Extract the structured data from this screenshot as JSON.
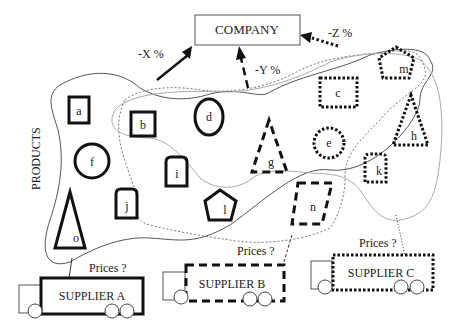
{
  "diagram": {
    "company": {
      "label": "COMPANY"
    },
    "side_label": "PRODUCTS",
    "discounts": [
      {
        "id": "x",
        "label": "-X %",
        "line_style": "solid"
      },
      {
        "id": "y",
        "label": "-Y %",
        "line_style": "dashed"
      },
      {
        "id": "z",
        "label": "-Z %",
        "line_style": "dotted"
      }
    ],
    "products": [
      {
        "id": "a",
        "label": "a",
        "shape": "square",
        "style": "solid"
      },
      {
        "id": "b",
        "label": "b",
        "shape": "square",
        "style": "solid"
      },
      {
        "id": "c",
        "label": "c",
        "shape": "rectangle",
        "style": "dotted"
      },
      {
        "id": "d",
        "label": "d",
        "shape": "ellipse",
        "style": "solid"
      },
      {
        "id": "e",
        "label": "e",
        "shape": "circle",
        "style": "dotted"
      },
      {
        "id": "f",
        "label": "f",
        "shape": "circle",
        "style": "solid"
      },
      {
        "id": "g",
        "label": "g",
        "shape": "triangle",
        "style": "dashed"
      },
      {
        "id": "h",
        "label": "h",
        "shape": "triangle",
        "style": "dotted"
      },
      {
        "id": "i",
        "label": "i",
        "shape": "tag",
        "style": "solid"
      },
      {
        "id": "j",
        "label": "j",
        "shape": "tag",
        "style": "solid"
      },
      {
        "id": "k",
        "label": "k",
        "shape": "tag",
        "style": "dotted"
      },
      {
        "id": "l",
        "label": "l",
        "shape": "pentagon",
        "style": "solid"
      },
      {
        "id": "m",
        "label": "m",
        "shape": "pentagon",
        "style": "dotted"
      },
      {
        "id": "n",
        "label": "n",
        "shape": "parallelogram",
        "style": "dashed"
      },
      {
        "id": "o",
        "label": "o",
        "shape": "triangle",
        "style": "solid"
      }
    ],
    "suppliers": [
      {
        "id": "a",
        "label": "SUPPLIER A",
        "style": "solid",
        "question": "Prices ?"
      },
      {
        "id": "b",
        "label": "SUPPLIER B",
        "style": "dashed",
        "question": "Prices ?"
      },
      {
        "id": "c",
        "label": "SUPPLIER C",
        "style": "dotted",
        "question": "Prices ?"
      }
    ]
  }
}
